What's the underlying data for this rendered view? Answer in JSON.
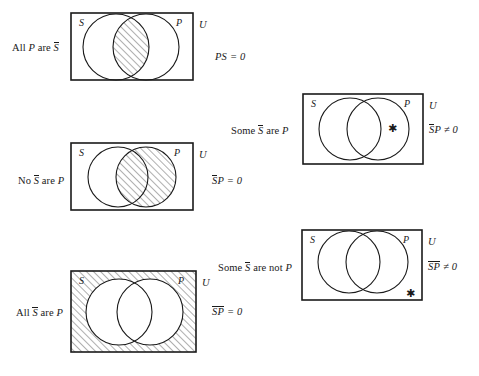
{
  "figure": {
    "title": "Venn diagrams for categorical propositions with complement terms",
    "hatch_color": "#1a1a1a",
    "line_color": "#1a1a1a",
    "background": "#ffffff"
  },
  "diagrams": [
    {
      "id": "all-p-are-not-s",
      "proposition_prefix": "All ",
      "proposition_subject": "P",
      "proposition_middle": " are ",
      "proposition_predicate": "S",
      "predicate_overlined": true,
      "subject_overlined": false,
      "equation_left": "PS",
      "equation_overline_span": "none",
      "equation_relation": " = ",
      "equation_right": "0",
      "left_circle_label": "S",
      "right_circle_label": "P",
      "universe_label": "U",
      "shading": "intersection",
      "star": null
    },
    {
      "id": "no-not-s-are-p",
      "proposition_prefix": "No ",
      "proposition_subject": "S",
      "proposition_middle": " are ",
      "proposition_predicate": "P",
      "predicate_overlined": false,
      "subject_overlined": true,
      "equation_left": "SP",
      "equation_overline_span": "first",
      "equation_relation": " = ",
      "equation_right": "0",
      "left_circle_label": "S",
      "right_circle_label": "P",
      "universe_label": "U",
      "shading": "right-circle",
      "star": null
    },
    {
      "id": "all-not-s-are-p",
      "proposition_prefix": "All ",
      "proposition_subject": "S",
      "proposition_middle": " are ",
      "proposition_predicate": "P",
      "predicate_overlined": false,
      "subject_overlined": true,
      "equation_left": "SP",
      "equation_overline_span": "both",
      "equation_relation": " = ",
      "equation_right": "0",
      "left_circle_label": "S",
      "right_circle_label": "P",
      "universe_label": "U",
      "shading": "outside-both",
      "star": null
    },
    {
      "id": "some-not-s-are-p",
      "proposition_prefix": "Some ",
      "proposition_subject": "S",
      "proposition_middle": " are ",
      "proposition_predicate": "P",
      "predicate_overlined": false,
      "subject_overlined": true,
      "equation_left": "SP",
      "equation_overline_span": "first",
      "equation_relation": " ≠ ",
      "equation_right": "0",
      "left_circle_label": "S",
      "right_circle_label": "P",
      "universe_label": "U",
      "shading": "none",
      "star": "✱",
      "star_position": "inside-right-circle"
    },
    {
      "id": "some-not-s-are-not-p",
      "proposition_prefix": "Some ",
      "proposition_subject": "S",
      "proposition_middle": " are not ",
      "proposition_predicate": "P",
      "predicate_overlined": false,
      "subject_overlined": true,
      "equation_left": "SP",
      "equation_overline_span": "both",
      "equation_relation": " ≠ ",
      "equation_right": "0",
      "left_circle_label": "S",
      "right_circle_label": "P",
      "universe_label": "U",
      "shading": "none",
      "star": "✱",
      "star_position": "outside-bottom-right"
    }
  ]
}
